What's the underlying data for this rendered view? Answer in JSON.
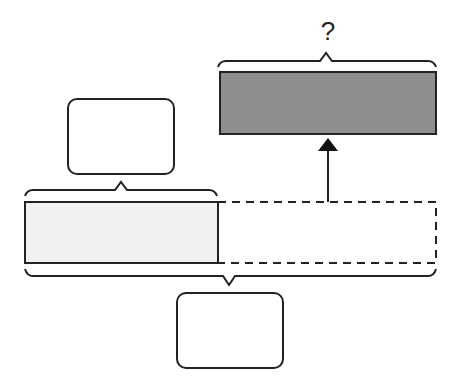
{
  "diagram": {
    "type": "tape-diagram",
    "top_label": "?",
    "colors": {
      "stroke": "#222222",
      "result_bar_fill": "#8e8e8e",
      "known_bar_fill": "#f1f1f1",
      "background": "#ffffff"
    },
    "elements": {
      "result_bar": {
        "label": "?",
        "fill": "dark gray"
      },
      "known_part_box": {
        "value": ""
      },
      "known_bar": {
        "fill": "light gray"
      },
      "unknown_extension": {
        "style": "dashed"
      },
      "total_box": {
        "value": ""
      }
    }
  }
}
